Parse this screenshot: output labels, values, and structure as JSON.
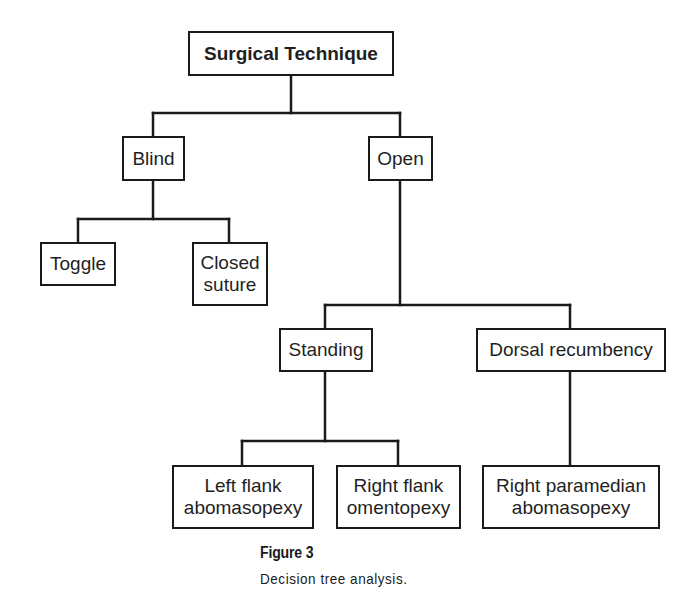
{
  "diagram": {
    "type": "decision-tree",
    "root": {
      "id": "surgical-technique",
      "label": "Surgical Technique"
    },
    "nodes": {
      "blind": "Blind",
      "open": "Open",
      "toggle": "Toggle",
      "closed_suture": "Closed\nsuture",
      "standing": "Standing",
      "dorsal_recumbency": "Dorsal recumbency",
      "left_flank_abomasopexy": "Left flank\nabomasopexy",
      "right_flank_omentopexy": "Right flank\nomentopexy",
      "right_paramedian_abomasopexy": "Right paramedian\nabomasopexy"
    },
    "edges": [
      [
        "Surgical Technique",
        "Blind"
      ],
      [
        "Surgical Technique",
        "Open"
      ],
      [
        "Blind",
        "Toggle"
      ],
      [
        "Blind",
        "Closed suture"
      ],
      [
        "Open",
        "Standing"
      ],
      [
        "Open",
        "Dorsal recumbency"
      ],
      [
        "Standing",
        "Left flank abomasopexy"
      ],
      [
        "Standing",
        "Right flank omentopexy"
      ],
      [
        "Dorsal recumbency",
        "Right paramedian abomasopexy"
      ]
    ],
    "colors": {
      "line": "#1a1a1a",
      "background": "#ffffff"
    }
  },
  "figure": {
    "label": "Figure 3",
    "caption": "Decision tree analysis."
  }
}
